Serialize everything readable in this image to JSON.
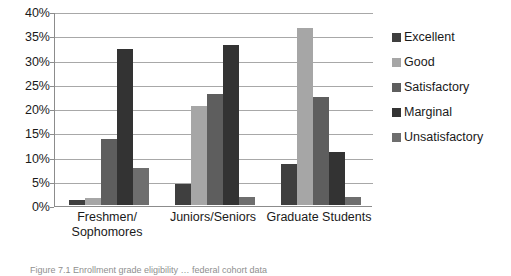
{
  "chart_data": {
    "type": "bar",
    "title": "",
    "xlabel": "",
    "ylabel": "",
    "ylim": [
      0,
      40
    ],
    "ytick_labels": [
      "40%",
      "35%",
      "30%",
      "25%",
      "20%",
      "15%",
      "10%",
      "5%",
      "0%"
    ],
    "ytick_values": [
      40,
      35,
      30,
      25,
      20,
      15,
      10,
      5,
      0
    ],
    "grid": true,
    "legend_position": "right",
    "categories": [
      "Freshmen/\nSophomores",
      "Juniors/Seniors",
      "Graduate Students"
    ],
    "category_labels": [
      {
        "line1": "Freshmen/",
        "line2": "Sophomores"
      },
      {
        "line1": "Juniors/Seniors",
        "line2": ""
      },
      {
        "line1": "Graduate Students",
        "line2": ""
      }
    ],
    "series": [
      {
        "name": "Excellent",
        "color": "#3f3f3f",
        "values": [
          1.0,
          4.4,
          8.5
        ]
      },
      {
        "name": "Good",
        "color": "#a6a6a6",
        "values": [
          1.5,
          20.4,
          36.6
        ]
      },
      {
        "name": "Satisfactory",
        "color": "#5e5e5e",
        "values": [
          13.7,
          22.8,
          22.2
        ]
      },
      {
        "name": "Marginal",
        "color": "#333333",
        "values": [
          32.2,
          33.0,
          11.0
        ]
      },
      {
        "name": "Unsatisfactory",
        "color": "#6e6e6e",
        "values": [
          7.6,
          1.6,
          1.6
        ]
      }
    ]
  },
  "caption": {
    "text": "Figure 7.1  Enrollment grade eligibility … federal cohort data"
  }
}
